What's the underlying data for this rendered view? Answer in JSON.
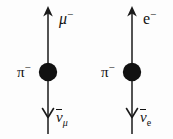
{
  "figure": {
    "type": "feynman-diagram-pair",
    "background_color": "#fdfdfd",
    "ink_color": "#121212",
    "width": 173,
    "height": 139
  },
  "diagrams": [
    {
      "id": "muon-channel",
      "process": "pi- -> mu- + anti-nu_mu",
      "incoming": {
        "particle": "π",
        "charge": "−",
        "label_position": "left-of-vertex"
      },
      "outgoing_up": {
        "particle": "μ",
        "charge": "−",
        "label_position": "upper-right",
        "arrow_direction": "up"
      },
      "outgoing_down": {
        "particle": "ν",
        "overbar": true,
        "subscript": "μ",
        "label_position": "lower-right",
        "arrow_direction": "down"
      },
      "vertex": {
        "style": "filled-blob",
        "cx": 48,
        "cy": 72,
        "r": 9
      },
      "line_x": 48
    },
    {
      "id": "electron-channel",
      "process": "pi- -> e- + anti-nu_e",
      "incoming": {
        "particle": "π",
        "charge": "−",
        "label_position": "left-of-vertex"
      },
      "outgoing_up": {
        "particle": "e",
        "charge": "−",
        "label_position": "upper-right",
        "arrow_direction": "up"
      },
      "outgoing_down": {
        "particle": "ν",
        "overbar": true,
        "subscript": "e",
        "label_position": "lower-right",
        "arrow_direction": "down"
      },
      "vertex": {
        "style": "filled-blob",
        "cx": 46,
        "cy": 72,
        "r": 9
      },
      "line_x": 46
    }
  ],
  "labels": {
    "muon": {
      "symbol": "μ",
      "superscript": "−"
    },
    "electron": {
      "symbol": "e",
      "superscript": "−"
    },
    "pion_left": {
      "symbol": "π",
      "superscript": "−"
    },
    "pion_right": {
      "symbol": "π",
      "superscript": "−"
    },
    "antineutrino_mu": {
      "symbol": "ν",
      "subscript": "μ"
    },
    "antineutrino_e": {
      "symbol": "ν",
      "subscript": "e"
    }
  }
}
